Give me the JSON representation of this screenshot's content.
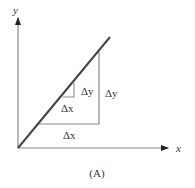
{
  "diagram": {
    "caption": "(A)",
    "axes": {
      "x_label": "x",
      "y_label": "y"
    },
    "large_triangle": {
      "dx_label": "Δx",
      "dy_label": "Δy"
    },
    "small_triangle": {
      "dx_label": "Δx",
      "dy_label": "Δy"
    },
    "colors": {
      "line": "#444444",
      "axes": "#888888",
      "triangle": "#8a8a8a",
      "text": "#333333"
    }
  }
}
